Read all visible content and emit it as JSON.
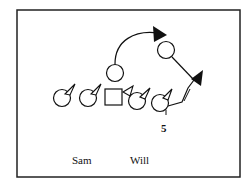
{
  "diagram": {
    "type": "football-play-diagram",
    "frame": {
      "x": 17,
      "y": 10,
      "w": 223,
      "h": 167,
      "stroke": "#222222"
    },
    "players": [
      {
        "id": "p1",
        "shape": "circle",
        "cx": 62,
        "cy": 98,
        "r": 9,
        "cone": true
      },
      {
        "id": "p2",
        "shape": "circle",
        "cx": 88,
        "cy": 98,
        "r": 9,
        "cone": true
      },
      {
        "id": "center",
        "shape": "square",
        "x": 105,
        "y": 89,
        "w": 17,
        "h": 17
      },
      {
        "id": "p4",
        "shape": "circle",
        "cx": 137,
        "cy": 100,
        "r": 9,
        "cone": true
      },
      {
        "id": "p5",
        "shape": "circle",
        "cx": 160,
        "cy": 102,
        "r": 9,
        "cone": true
      },
      {
        "id": "qb",
        "shape": "circle",
        "cx": 115,
        "cy": 73,
        "r": 9,
        "cone": false
      },
      {
        "id": "receiver",
        "shape": "circle",
        "cx": 167,
        "cy": 50,
        "r": 9,
        "cone": false
      }
    ],
    "labels": {
      "number": "5",
      "sam": "Sam",
      "will": "Will"
    }
  }
}
